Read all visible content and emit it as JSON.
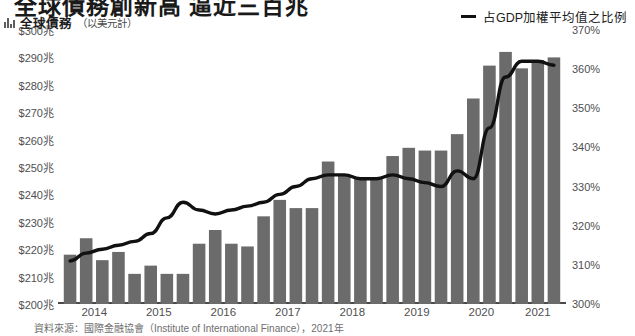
{
  "headline": "全球債務創新高 逼近三百兆",
  "legend": {
    "left_marker": "bar-chart-icon",
    "left_label": "全球債務",
    "left_unit": "（以美元計）",
    "right_marker": "line-icon",
    "right_label": "占GDP加權平均值之比例"
  },
  "source_note": "資料來源：國際金融協會（Institute of International Finance），2021年",
  "chart_data": {
    "type": "bar",
    "title": "全球債務創新高 逼近三百兆",
    "xlabel": "",
    "ylabel": "全球債務（以美元計）",
    "y2label": "占GDP加權平均值之比例",
    "grid": false,
    "legend_position": "top",
    "ylim": [
      200,
      300
    ],
    "y2lim": [
      300,
      370
    ],
    "yticks": [
      "$200兆",
      "$210兆",
      "$220兆",
      "$230兆",
      "$240兆",
      "$250兆",
      "$260兆",
      "$270兆",
      "$280兆",
      "$290兆",
      "$300兆"
    ],
    "ytick_values": [
      200,
      210,
      220,
      230,
      240,
      250,
      260,
      270,
      280,
      290,
      300
    ],
    "y2ticks": [
      "300%",
      "310%",
      "320%",
      "330%",
      "340%",
      "350%",
      "360%",
      "370%"
    ],
    "y2tick_values": [
      300,
      310,
      320,
      330,
      340,
      350,
      360,
      370
    ],
    "xticks": [
      "2014",
      "2015",
      "2016",
      "2017",
      "2018",
      "2019",
      "2020",
      "2021"
    ],
    "categories": [
      "2014Q1",
      "2014Q2",
      "2014Q3",
      "2014Q4",
      "2015Q1",
      "2015Q2",
      "2015Q3",
      "2015Q4",
      "2016Q1",
      "2016Q2",
      "2016Q3",
      "2016Q4",
      "2017Q1",
      "2017Q2",
      "2017Q3",
      "2017Q4",
      "2018Q1",
      "2018Q2",
      "2018Q3",
      "2018Q4",
      "2019Q1",
      "2019Q2",
      "2019Q3",
      "2019Q4",
      "2020Q1",
      "2020Q2",
      "2020Q3",
      "2020Q4",
      "2021Q1",
      "2021Q2",
      "2021Q3"
    ],
    "series": [
      {
        "name": "全球債務",
        "type": "bar",
        "axis": "left",
        "unit": "兆美元",
        "color": "#6b6b6b",
        "values": [
          218,
          224,
          216,
          219,
          211,
          214,
          211,
          211,
          222,
          227,
          222,
          221,
          232,
          238,
          235,
          235,
          252,
          247,
          246,
          246,
          254,
          257,
          256,
          256,
          262,
          275,
          287,
          292,
          286,
          289,
          290
        ]
      },
      {
        "name": "占GDP加權平均值之比例",
        "type": "line",
        "axis": "right",
        "unit": "%",
        "color": "#111111",
        "values": [
          311,
          313,
          314,
          315,
          316,
          318,
          322,
          326,
          324,
          323,
          324,
          325,
          326,
          328,
          330,
          332,
          333,
          333,
          332,
          332,
          333,
          332,
          331,
          330,
          334,
          332,
          345,
          358,
          362,
          362,
          361
        ]
      }
    ]
  }
}
